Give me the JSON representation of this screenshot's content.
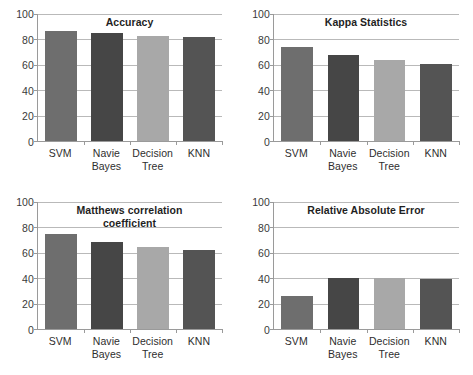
{
  "figure": {
    "background": "#ffffff",
    "layout": "2x2 grid of bar charts"
  },
  "axis": {
    "yticks": [
      0,
      20,
      40,
      60,
      80,
      100
    ],
    "ylabels": [
      "0",
      "20",
      "40",
      "60",
      "80",
      "100"
    ]
  },
  "categories": [
    "SVM",
    "Navie\nBayes",
    "Decision\nTree",
    "KNN"
  ],
  "colors": {
    "svm": "#6e6e6e",
    "navie_bayes": "#464646",
    "decision_tree": "#a8a8a8",
    "knn": "#545454",
    "gridline": "#b9b9b9",
    "axis": "#9a9a9a",
    "text": "#2e2e2e",
    "title_text": "#1f1f1f"
  },
  "panels": [
    {
      "id": "accuracy",
      "title": "Accuracy",
      "title_lines": [
        "Accuracy"
      ],
      "values": [
        87,
        85,
        83,
        82
      ]
    },
    {
      "id": "kappa-statistics",
      "title": "Kappa Statistics",
      "title_lines": [
        "Kappa Statistics"
      ],
      "values": [
        74,
        68,
        64,
        61
      ]
    },
    {
      "id": "matthews-correlation-coefficient",
      "title": "Matthews correlation coefficient",
      "title_lines": [
        "Matthews correlation",
        "coefficient"
      ],
      "values": [
        74.5,
        68.5,
        64.5,
        62
      ]
    },
    {
      "id": "relative-absolute-error",
      "title": "Relative Absolute Error",
      "title_lines": [
        "Relative Absolute Error"
      ],
      "values": [
        26,
        40.5,
        40.5,
        39
      ]
    }
  ],
  "chart_data": [
    {
      "type": "bar",
      "title": "Accuracy",
      "categories": [
        "SVM",
        "Navie Bayes",
        "Decision Tree",
        "KNN"
      ],
      "values": [
        87,
        85,
        83,
        82
      ],
      "xlabel": "",
      "ylabel": "",
      "ylim": [
        0,
        100
      ],
      "yticks": [
        0,
        20,
        40,
        60,
        80,
        100
      ],
      "grid": true,
      "legend": "none"
    },
    {
      "type": "bar",
      "title": "Kappa Statistics",
      "categories": [
        "SVM",
        "Navie Bayes",
        "Decision Tree",
        "KNN"
      ],
      "values": [
        74,
        68,
        64,
        61
      ],
      "xlabel": "",
      "ylabel": "",
      "ylim": [
        0,
        100
      ],
      "yticks": [
        0,
        20,
        40,
        60,
        80,
        100
      ],
      "grid": true,
      "legend": "none"
    },
    {
      "type": "bar",
      "title": "Matthews correlation coefficient",
      "categories": [
        "SVM",
        "Navie Bayes",
        "Decision Tree",
        "KNN"
      ],
      "values": [
        74.5,
        68.5,
        64.5,
        62
      ],
      "xlabel": "",
      "ylabel": "",
      "ylim": [
        0,
        100
      ],
      "yticks": [
        0,
        20,
        40,
        60,
        80,
        100
      ],
      "grid": true,
      "legend": "none"
    },
    {
      "type": "bar",
      "title": "Relative Absolute Error",
      "categories": [
        "SVM",
        "Navie Bayes",
        "Decision Tree",
        "KNN"
      ],
      "values": [
        26,
        40.5,
        40.5,
        39
      ],
      "xlabel": "",
      "ylabel": "",
      "ylim": [
        0,
        100
      ],
      "yticks": [
        0,
        20,
        40,
        60,
        80,
        100
      ],
      "grid": true,
      "legend": "none"
    }
  ]
}
